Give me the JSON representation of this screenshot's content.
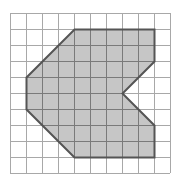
{
  "diagram": {
    "type": "grid-polygon",
    "grid": {
      "columns": 10,
      "rows": 10,
      "cell_size_px": 16,
      "origin_px": [
        10,
        13
      ],
      "line_color": "#a8a8a8"
    },
    "shape": {
      "vertices_grid": [
        [
          4,
          1
        ],
        [
          9,
          1
        ],
        [
          9,
          3
        ],
        [
          7,
          5
        ],
        [
          9,
          7
        ],
        [
          9,
          9
        ],
        [
          4,
          9
        ],
        [
          1,
          6
        ],
        [
          1,
          4
        ]
      ],
      "fill_color": "#c6c6c6",
      "stroke_color": "#555555",
      "inner_grid_color": "#7a7a7a"
    }
  }
}
